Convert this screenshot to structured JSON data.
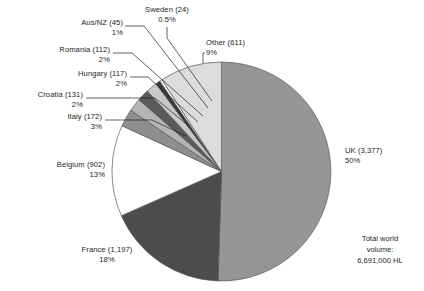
{
  "chart_data": {
    "type": "pie",
    "title": "",
    "subtitle": "",
    "xlabel": "",
    "ylabel": "",
    "legend_position": "callout-labels",
    "grid": false,
    "units": "HL",
    "total_label": {
      "line1": "Total world",
      "line2": "volume:",
      "line3": "6,691,000 HL"
    },
    "categories": [
      "UK",
      "France",
      "Belgium",
      "Italy",
      "Croatia",
      "Hungary",
      "Romania",
      "Aus/NZ",
      "Sweden",
      "Other"
    ],
    "values": [
      3377,
      1197,
      902,
      172,
      131,
      117,
      112,
      45,
      24,
      611
    ],
    "percents": [
      50,
      18,
      13,
      3,
      2,
      2,
      2,
      1,
      0.5,
      9
    ],
    "slices": [
      {
        "name": "UK",
        "value": 3377,
        "value_text": "3,377",
        "label": "UK (3,377)",
        "percent_text": "50%",
        "percent": 50,
        "color": "#969696",
        "start_deg": 0,
        "sweep_deg": 181.8
      },
      {
        "name": "France",
        "value": 1197,
        "value_text": "1,197",
        "label": "France (1,197)",
        "percent_text": "18%",
        "percent": 18,
        "color": "#4c4c4c",
        "start_deg": 181.8,
        "sweep_deg": 64.4
      },
      {
        "name": "Belgium",
        "value": 902,
        "value_text": "902",
        "label": "Belgium (902)",
        "percent_text": "13%",
        "percent": 13,
        "color": "#ffffff",
        "start_deg": 246.2,
        "sweep_deg": 48.5
      },
      {
        "name": "Italy",
        "value": 172,
        "value_text": "172",
        "label": "Italy (172)",
        "percent_text": "3%",
        "percent": 3,
        "color": "#8e8e8e",
        "start_deg": 294.7,
        "sweep_deg": 9.3
      },
      {
        "name": "Croatia",
        "value": 131,
        "value_text": "131",
        "label": "Croatia (131)",
        "percent_text": "2%",
        "percent": 2,
        "color": "#b4b4b4",
        "start_deg": 304.0,
        "sweep_deg": 7.0
      },
      {
        "name": "Hungary",
        "value": 117,
        "value_text": "117",
        "label": "Hungary (117)",
        "percent_text": "2%",
        "percent": 2,
        "color": "#5a5a5a",
        "start_deg": 311.0,
        "sweep_deg": 6.3
      },
      {
        "name": "Romania",
        "value": 112,
        "value_text": "112",
        "label": "Romania (112)",
        "percent_text": "2%",
        "percent": 2,
        "color": "#c8c8c8",
        "start_deg": 317.3,
        "sweep_deg": 6.0
      },
      {
        "name": "Aus/NZ",
        "value": 45,
        "value_text": "45",
        "label": "Aus/NZ (45)",
        "percent_text": "1%",
        "percent": 1,
        "color": "#3a3a3a",
        "start_deg": 323.3,
        "sweep_deg": 2.4
      },
      {
        "name": "Sweden",
        "value": 24,
        "value_text": "24",
        "label": "Sweden (24)",
        "percent_text": "0.5%",
        "percent": 0.5,
        "color": "#ffffff",
        "start_deg": 325.7,
        "sweep_deg": 1.3
      },
      {
        "name": "Other",
        "value": 611,
        "value_text": "611",
        "label": "Other (611)",
        "percent_text": "9%",
        "percent": 9,
        "color": "#dcdcdc",
        "start_deg": 327.0,
        "sweep_deg": 33.0
      }
    ]
  },
  "colors": {
    "text": "#231f20",
    "outline": "#58595b",
    "leader": "#231f20",
    "background": "#ffffff"
  }
}
